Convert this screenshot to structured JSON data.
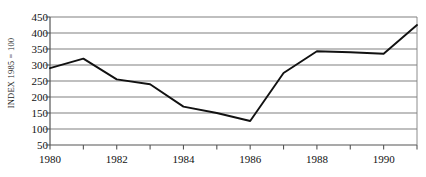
{
  "chart_data": {
    "type": "line",
    "title": "",
    "xlabel": "",
    "ylabel": "INDEX 1985 = 100",
    "x": [
      1980,
      1981,
      1982,
      1983,
      1984,
      1985,
      1986,
      1987,
      1988,
      1989,
      1990,
      1991
    ],
    "values": [
      290,
      320,
      255,
      240,
      170,
      150,
      125,
      275,
      343,
      340,
      335,
      425
    ],
    "series": [
      {
        "name": "index",
        "values": [
          290,
          320,
          255,
          240,
          170,
          150,
          125,
          275,
          343,
          340,
          335,
          425
        ]
      }
    ],
    "xlim": [
      1980,
      1991
    ],
    "ylim": [
      50,
      450
    ],
    "ytick_labels": [
      "50",
      "100",
      "150",
      "200",
      "250",
      "300",
      "350",
      "400",
      "450"
    ],
    "ytick_values": [
      50,
      100,
      150,
      200,
      250,
      300,
      350,
      400,
      450
    ],
    "xtick_values": [
      1980,
      1981,
      1982,
      1983,
      1984,
      1985,
      1986,
      1987,
      1988,
      1989,
      1990,
      1991
    ],
    "xtick_labels_shown": [
      {
        "value": 1980,
        "label": "1980"
      },
      {
        "value": 1982,
        "label": "1982"
      },
      {
        "value": 1984,
        "label": "1984"
      },
      {
        "value": 1986,
        "label": "1986"
      },
      {
        "value": 1988,
        "label": "1988"
      },
      {
        "value": 1990,
        "label": "1990"
      }
    ],
    "grid": true,
    "grid_axis": "y",
    "legend": false,
    "legend_position": "none",
    "line_color": "#111111",
    "grid_color": "#808080",
    "axis_color": "#555555",
    "background": "#ffffff"
  }
}
